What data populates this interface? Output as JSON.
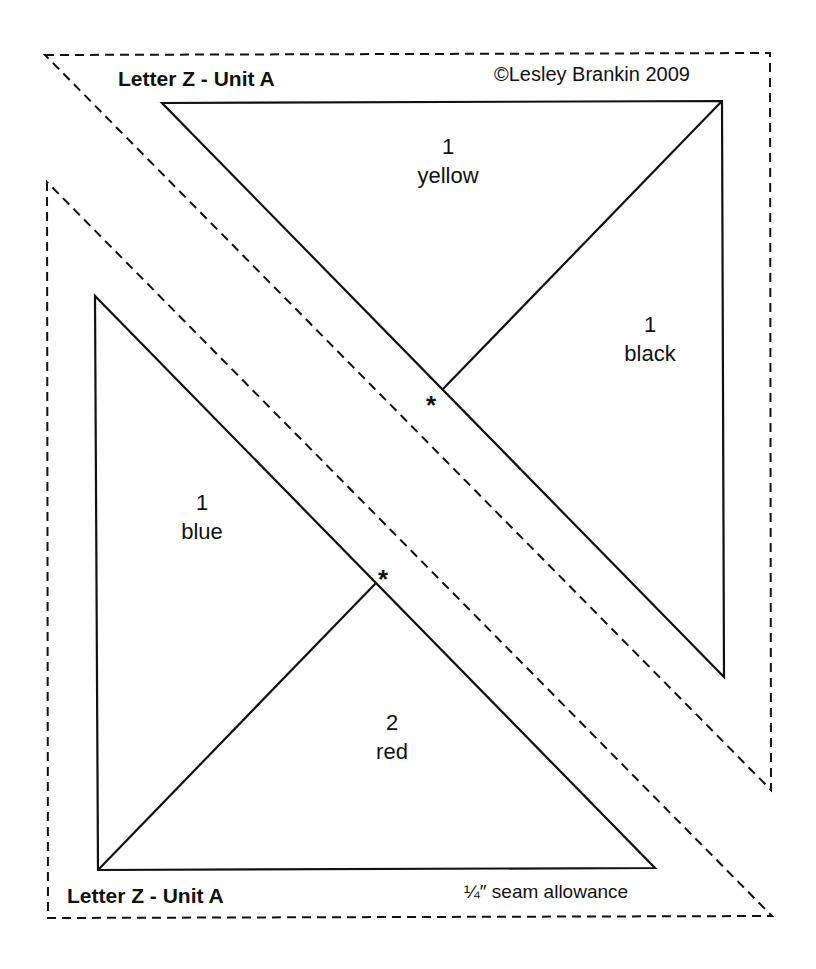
{
  "diagram": {
    "type": "paper-piecing quilt pattern",
    "upper_unit": {
      "title": "Letter Z - Unit A",
      "copyright": "©Lesley Brankin 2009",
      "pieces": [
        {
          "number": "1",
          "color": "yellow"
        },
        {
          "number": "1",
          "color": "black"
        }
      ],
      "marker": "*"
    },
    "lower_unit": {
      "title": "Letter Z - Unit A",
      "seam_note": "¼″ seam allowance",
      "pieces": [
        {
          "number": "1",
          "color": "blue"
        },
        {
          "number": "2",
          "color": "red"
        }
      ],
      "marker": "*"
    },
    "line_color": "#111111",
    "background": "#ffffff"
  }
}
